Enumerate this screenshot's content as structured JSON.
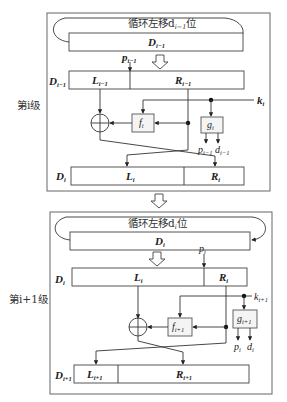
{
  "stages": [
    {
      "label": "第i级",
      "shift_label": "循环左移d",
      "shift_sub": "i−1",
      "shift_suffix": "位",
      "top_register": {
        "name": "D",
        "sub": "i−1"
      },
      "split_register": {
        "name": "D",
        "sub": "i−1",
        "left": {
          "name": "L",
          "sub": "i−1"
        },
        "right": {
          "name": "R",
          "sub": "i−1"
        }
      },
      "split_input": {
        "name": "p",
        "sub": "i−1"
      },
      "key": {
        "name": "k",
        "sub": "i"
      },
      "f_box": {
        "name": "f",
        "sub": "i"
      },
      "g_box": {
        "name": "g",
        "sub": "i"
      },
      "g_outputs": [
        {
          "name": "p",
          "sub": "i−1"
        },
        {
          "name": "d",
          "sub": "i−1"
        }
      ],
      "output_register": {
        "name": "D",
        "sub": "i",
        "left": {
          "name": "L",
          "sub": "i"
        },
        "right": {
          "name": "R",
          "sub": "i"
        }
      }
    },
    {
      "label": "第i+1级",
      "shift_label": "循环左移d",
      "shift_sub": "i",
      "shift_suffix": "位",
      "top_register": {
        "name": "D",
        "sub": "i"
      },
      "split_register": {
        "name": "D",
        "sub": "i",
        "left": {
          "name": "L",
          "sub": "i"
        },
        "right": {
          "name": "R",
          "sub": "i"
        }
      },
      "split_input": {
        "name": "p",
        "sub": "i"
      },
      "key": {
        "name": "k",
        "sub": "i+1"
      },
      "f_box": {
        "name": "f",
        "sub": "i+1"
      },
      "g_box": {
        "name": "g",
        "sub": "i+1"
      },
      "g_outputs": [
        {
          "name": "p",
          "sub": "i"
        },
        {
          "name": "d",
          "sub": "i"
        }
      ],
      "output_register": {
        "name": "D",
        "sub": "i+1",
        "left": {
          "name": "L",
          "sub": "i+1"
        },
        "right": {
          "name": "R",
          "sub": "i+1"
        }
      }
    }
  ],
  "symbols": {
    "xor": "⊕"
  }
}
